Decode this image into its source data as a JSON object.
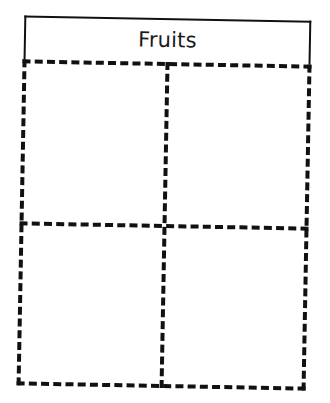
{
  "worksheet": {
    "title": "Fruits",
    "layout": {
      "rows": 2,
      "columns": 2
    },
    "cells": [
      {
        "row": 1,
        "column": 1,
        "content": ""
      },
      {
        "row": 1,
        "column": 2,
        "content": ""
      },
      {
        "row": 2,
        "column": 1,
        "content": ""
      },
      {
        "row": 2,
        "column": 2,
        "content": ""
      }
    ],
    "colors": {
      "ink": "#111111",
      "paper": "#ffffff"
    }
  }
}
